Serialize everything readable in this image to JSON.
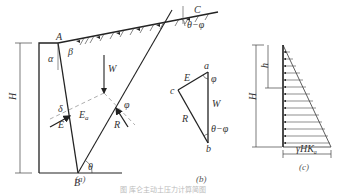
{
  "figure": {
    "caption": "图 库仑主动土压力计算简图",
    "panel_a": {
      "label": "(a)",
      "points": {
        "A": "A",
        "B": "B",
        "C": "C"
      },
      "angles": {
        "alpha": "α",
        "beta": "β",
        "delta": "δ",
        "phi": "φ",
        "theta": "θ",
        "theta_minus_phi": "θ−φ"
      },
      "forces": {
        "W": "W",
        "E": "E",
        "Ea": "Ea",
        "R": "R"
      },
      "height_label": "H"
    },
    "panel_b": {
      "label": "(b)",
      "vertices": {
        "a": "a",
        "b": "b",
        "c": "c"
      },
      "forces": {
        "E": "E",
        "W": "W",
        "R": "R"
      },
      "angles": {
        "phi": "φ",
        "theta_minus_phi": "θ−φ"
      }
    },
    "panel_c": {
      "label": "(c)",
      "height_label": "H",
      "depth_label": "h",
      "base_value": "γHKa"
    }
  }
}
